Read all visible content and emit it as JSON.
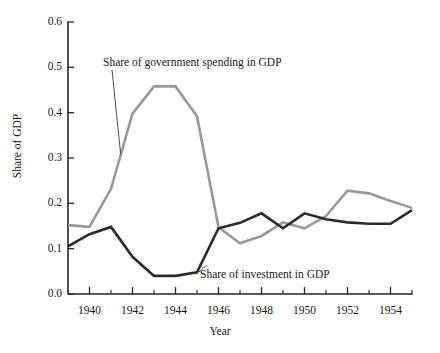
{
  "chart_data": {
    "type": "line",
    "title": "",
    "xlabel": "Year",
    "ylabel": "Share of GDP",
    "xlim": [
      1939,
      1955
    ],
    "ylim": [
      0.0,
      0.6
    ],
    "grid": false,
    "legend_position": "inline-annotations",
    "x": [
      1939,
      1940,
      1941,
      1942,
      1943,
      1944,
      1945,
      1946,
      1947,
      1948,
      1949,
      1950,
      1951,
      1952,
      1953,
      1954,
      1955
    ],
    "xticks_major": [
      1940,
      1942,
      1944,
      1946,
      1948,
      1950,
      1952,
      1954
    ],
    "xticks_minor": [
      1939,
      1941,
      1943,
      1945,
      1947,
      1949,
      1951,
      1953,
      1955
    ],
    "yticks": [
      "0.0",
      "0.1",
      "0.2",
      "0.3",
      "0.4",
      "0.5",
      "0.6"
    ],
    "ytick_values": [
      0.0,
      0.1,
      0.2,
      0.3,
      0.4,
      0.5,
      0.6
    ],
    "series": [
      {
        "name": "Share of government spending in GDP",
        "color": "#999999",
        "width": 2.6,
        "values": [
          0.152,
          0.148,
          0.232,
          0.398,
          0.458,
          0.458,
          0.392,
          0.147,
          0.112,
          0.128,
          0.158,
          0.145,
          0.172,
          0.228,
          0.222,
          0.205,
          0.19
        ]
      },
      {
        "name": "Share of investment in GDP",
        "color": "#2a2a2a",
        "width": 2.6,
        "values": [
          0.105,
          0.132,
          0.148,
          0.082,
          0.04,
          0.04,
          0.048,
          0.145,
          0.157,
          0.178,
          0.145,
          0.178,
          0.165,
          0.158,
          0.155,
          0.155,
          0.185
        ]
      }
    ],
    "annotations": [
      {
        "text": "Share of government spending in GDP",
        "target_x": 1941.45,
        "target_y": 0.308
      },
      {
        "text": "Share of investment in GDP",
        "target_x": 1945.45,
        "target_y": 0.063
      }
    ]
  },
  "axis": {
    "x_title": "Year",
    "y_title": "Share of GDP"
  }
}
